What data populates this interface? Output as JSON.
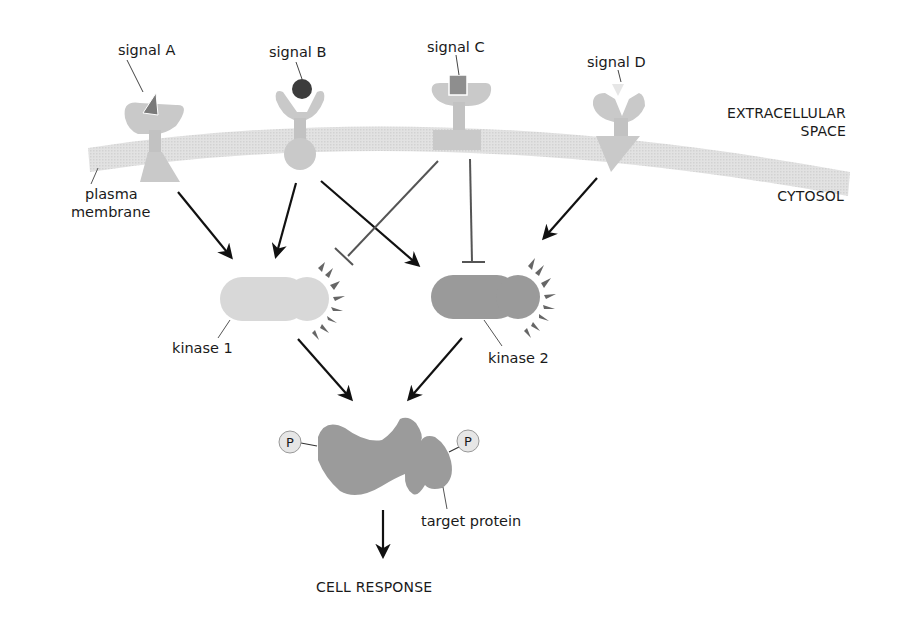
{
  "regions": {
    "extracellular_line1": "EXTRACELLULAR",
    "extracellular_line2": "SPACE",
    "cytosol": "CYTOSOL"
  },
  "membrane": {
    "label_line1": "plasma",
    "label_line2": "membrane"
  },
  "signals": [
    {
      "id": "A",
      "label": "signal A",
      "shape": "triangle",
      "color": "#7a7a7a"
    },
    {
      "id": "B",
      "label": "signal B",
      "shape": "circle",
      "color": "#3c3c3c"
    },
    {
      "id": "C",
      "label": "signal C",
      "shape": "square",
      "color": "#8e8e8e"
    },
    {
      "id": "D",
      "label": "signal D",
      "shape": "inverted-triangle",
      "color": "#e6e6e6"
    }
  ],
  "kinases": [
    {
      "id": "k1",
      "label": "kinase 1",
      "color": "#d8d8d8"
    },
    {
      "id": "k2",
      "label": "kinase 2",
      "color": "#9a9a9a"
    }
  ],
  "target": {
    "label": "target protein",
    "phosphate_label": "P",
    "color": "#9b9b9b"
  },
  "output": {
    "label": "CELL RESPONSE"
  },
  "edges": [
    {
      "from": "receptor A",
      "to": "kinase 1",
      "type": "activate"
    },
    {
      "from": "receptor B",
      "to": "kinase 1",
      "type": "activate"
    },
    {
      "from": "receptor B",
      "to": "kinase 2",
      "type": "activate"
    },
    {
      "from": "receptor C",
      "to": "kinase 1",
      "type": "inhibit"
    },
    {
      "from": "receptor C",
      "to": "kinase 2",
      "type": "inhibit"
    },
    {
      "from": "receptor D",
      "to": "kinase 2",
      "type": "activate"
    },
    {
      "from": "kinase 1",
      "to": "target protein",
      "type": "activate"
    },
    {
      "from": "kinase 2",
      "to": "target protein",
      "type": "activate"
    },
    {
      "from": "target protein",
      "to": "cell response",
      "type": "activate"
    }
  ],
  "colors": {
    "receptor": "#c9c9c9",
    "membrane": "#dcdcdc",
    "arrow": "#111111",
    "inhibit": "#555555"
  }
}
